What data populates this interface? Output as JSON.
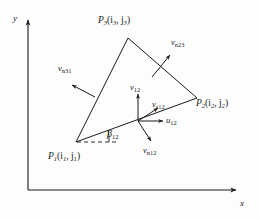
{
  "figure": {
    "type": "geometry-diagram",
    "background_color": "#fdfdfd",
    "line_color": "#1a1a1a",
    "axes": {
      "x_label": "x",
      "y_label": "y",
      "origin_px": [
        28,
        190
      ],
      "x_end_px": [
        238,
        190
      ],
      "y_end_px": [
        28,
        18
      ]
    },
    "triangle": {
      "vertices": [
        {
          "id": "P1",
          "label_main": "P",
          "label_sub": "1",
          "coords_text": "(i",
          "coord_sub1": "1",
          "coord_mid": ", j",
          "coord_sub2": "1",
          "coord_end": ")",
          "full": "P1(i1, j1)",
          "px": [
            76,
            142
          ]
        },
        {
          "id": "P2",
          "label_main": "P",
          "label_sub": "2",
          "coords_text": "(i",
          "coord_sub1": "2",
          "coord_mid": ", j",
          "coord_sub2": "2",
          "coord_end": ")",
          "full": "P2(i2, j2)",
          "px": [
            197,
            98
          ]
        },
        {
          "id": "P3",
          "label_main": "P",
          "label_sub": "3",
          "coords_text": "(i",
          "coord_sub1": "3",
          "coord_mid": ", j",
          "coord_sub2": "3",
          "coord_end": ")",
          "full": "P3(i3, j3)",
          "px": [
            128,
            38
          ]
        }
      ]
    },
    "vectors": [
      {
        "id": "vn23",
        "base": "v",
        "sub": "n23",
        "desc": "outward-normal-edge-23"
      },
      {
        "id": "vn31",
        "base": "v",
        "sub": "n31",
        "desc": "outward-normal-edge-31"
      },
      {
        "id": "v12",
        "base": "v",
        "sub": "12",
        "desc": "vector-12"
      },
      {
        "id": "vs12",
        "base": "v",
        "sub": "s12",
        "desc": "tangential-vector-12"
      },
      {
        "id": "u12",
        "base": "u",
        "sub": "12",
        "desc": "unit-vector-12"
      },
      {
        "id": "vn12",
        "base": "v",
        "sub": "n12",
        "desc": "inward-normal-edge-12"
      }
    ],
    "angle": {
      "id": "beta12",
      "base": "β",
      "sub": "12",
      "desc": "angle-between-x-and-edge-12"
    }
  }
}
